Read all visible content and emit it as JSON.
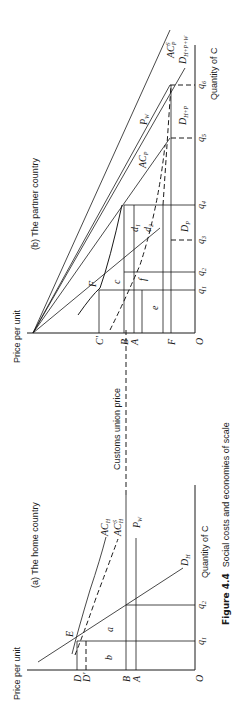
{
  "figure": {
    "number": "Figure 4.4",
    "caption": "Social costs and economies of scale",
    "orientation": "rotated 90 degrees counter-clockwise"
  },
  "shared": {
    "customs_union_price_label": "Customs union price"
  },
  "panel_a": {
    "title": "(a)  The home country",
    "y_axis_label": "Price per unit",
    "x_axis_label": "Quantity of C",
    "origin": "O",
    "price_ticks": [
      "D",
      "D'",
      "B",
      "A"
    ],
    "quantity_ticks": [
      "q1",
      "q2"
    ],
    "curves": [
      "ACH",
      "ACHS",
      "PW",
      "DH"
    ],
    "curve_labels": {
      "ach": "AC",
      "ach_sub": "H",
      "achs": "AC",
      "achs_sub": "H",
      "achs_sup": "S",
      "pw": "P",
      "pw_sub": "W",
      "dh": "D",
      "dh_sub": "H"
    },
    "points": [
      "E"
    ],
    "areas": [
      "a",
      "b"
    ]
  },
  "panel_b": {
    "title": "(b)  The partner country",
    "y_axis_label": "Price per unit",
    "x_axis_label": "Quantity of C",
    "origin": "O",
    "price_ticks": [
      "C'",
      "B",
      "A",
      "F"
    ],
    "quantity_ticks": [
      "q1",
      "q2",
      "q3",
      "q4",
      "q5",
      "q6"
    ],
    "curves": [
      "ACPS",
      "PW",
      "ACP",
      "DH+P",
      "DH+P+W",
      "DP"
    ],
    "curve_labels": {
      "acps": "AC",
      "acps_sub": "P",
      "acps_sup": "S",
      "pw": "P",
      "pw_sub": "W",
      "acp": "AC",
      "acp_sub": "P",
      "dhp": "D",
      "dhp_sub": "H+P",
      "dhpw": "D",
      "dhpw_sub": "H+P+W",
      "dp": "D",
      "dp_sub": "P"
    },
    "points": [
      "F"
    ],
    "areas": [
      "c",
      "d1",
      "d2",
      "e",
      "f"
    ]
  },
  "labels": {
    "O": "O",
    "D": "D",
    "Dp": "D'",
    "B": "B",
    "A": "A",
    "E": "E",
    "F": "F",
    "Cp": "C'",
    "q": "q",
    "a": "a",
    "b": "b",
    "c": "c",
    "d": "d",
    "e": "e",
    "f": "f",
    "n1": "1",
    "n2": "2",
    "n3": "3",
    "n4": "4",
    "n5": "5",
    "n6": "6"
  }
}
